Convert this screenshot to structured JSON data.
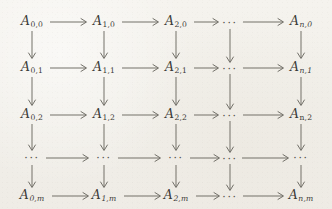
{
  "figure": {
    "kind": "commutative-diagram",
    "background_color": "#f2f0ea",
    "ink_color": "#3b3a36",
    "arrow_color": "#6b6962",
    "columns": 5,
    "rows": 5,
    "ellipsis_text": "···"
  },
  "grid": {
    "column_x": [
      32,
      104,
      176,
      230,
      301
    ],
    "row_y": [
      22,
      68,
      115,
      158,
      196
    ],
    "column_labels": [
      "0",
      "1",
      "2",
      "...",
      "n"
    ],
    "row_labels": [
      "0",
      "1",
      "2",
      "...",
      "m"
    ],
    "nodes": [
      [
        {
          "kind": "object",
          "base": "A",
          "sub": "0,0",
          "sub_italic": false
        },
        {
          "kind": "object",
          "base": "A",
          "sub": "1,0",
          "sub_italic": false
        },
        {
          "kind": "object",
          "base": "A",
          "sub": "2,0",
          "sub_italic": false
        },
        {
          "kind": "ellipsis",
          "text": "···"
        },
        {
          "kind": "object",
          "base": "A",
          "sub": "n,0",
          "sub_italic": true
        }
      ],
      [
        {
          "kind": "object",
          "base": "A",
          "sub": "0,1",
          "sub_italic": false
        },
        {
          "kind": "object",
          "base": "A",
          "sub": "1,1",
          "sub_italic": false
        },
        {
          "kind": "object",
          "base": "A",
          "sub": "2,1",
          "sub_italic": false
        },
        {
          "kind": "ellipsis",
          "text": "···"
        },
        {
          "kind": "object",
          "base": "A",
          "sub": "n,1",
          "sub_italic": true
        }
      ],
      [
        {
          "kind": "object",
          "base": "A",
          "sub": "0,2",
          "sub_italic": false
        },
        {
          "kind": "object",
          "base": "A",
          "sub": "1,2",
          "sub_italic": false
        },
        {
          "kind": "object",
          "base": "A",
          "sub": "2,2",
          "sub_italic": false
        },
        {
          "kind": "ellipsis",
          "text": "···"
        },
        {
          "kind": "object",
          "base": "A",
          "sub": "n,2",
          "sub_italic": false
        }
      ],
      [
        {
          "kind": "ellipsis",
          "text": "···"
        },
        {
          "kind": "ellipsis",
          "text": "···"
        },
        {
          "kind": "ellipsis",
          "text": "···"
        },
        {
          "kind": "ellipsis",
          "text": "···"
        },
        {
          "kind": "ellipsis",
          "text": "···"
        }
      ],
      [
        {
          "kind": "object",
          "base": "A",
          "sub": "0,m",
          "sub_italic": true
        },
        {
          "kind": "object",
          "base": "A",
          "sub": "1,m",
          "sub_italic": true
        },
        {
          "kind": "object",
          "base": "A",
          "sub": "2,m",
          "sub_italic": true
        },
        {
          "kind": "ellipsis",
          "text": "···"
        },
        {
          "kind": "object",
          "base": "A",
          "sub": "n,m",
          "sub_italic": true
        }
      ]
    ]
  },
  "nodes_flat": {
    "r0c0": {
      "base": "A",
      "sub": "0,0"
    },
    "r0c1": {
      "base": "A",
      "sub": "1,0"
    },
    "r0c2": {
      "base": "A",
      "sub": "2,0"
    },
    "r0c3": {
      "text": "···"
    },
    "r0c4": {
      "base": "A",
      "sub": "n,0"
    },
    "r1c0": {
      "base": "A",
      "sub": "0,1"
    },
    "r1c1": {
      "base": "A",
      "sub": "1,1"
    },
    "r1c2": {
      "base": "A",
      "sub": "2,1"
    },
    "r1c3": {
      "text": "···"
    },
    "r1c4": {
      "base": "A",
      "sub": "n,1"
    },
    "r2c0": {
      "base": "A",
      "sub": "0,2"
    },
    "r2c1": {
      "base": "A",
      "sub": "1,2"
    },
    "r2c2": {
      "base": "A",
      "sub": "2,2"
    },
    "r2c3": {
      "text": "···"
    },
    "r2c4": {
      "base": "A",
      "sub": "n,2"
    },
    "r3c0": {
      "text": "···"
    },
    "r3c1": {
      "text": "···"
    },
    "r3c2": {
      "text": "···"
    },
    "r3c3": {
      "text": "···"
    },
    "r3c4": {
      "text": "···"
    },
    "r4c0": {
      "base": "A",
      "sub": "0,m"
    },
    "r4c1": {
      "base": "A",
      "sub": "1,m"
    },
    "r4c2": {
      "base": "A",
      "sub": "2,m"
    },
    "r4c3": {
      "text": "···"
    },
    "r4c4": {
      "base": "A",
      "sub": "n,m"
    }
  },
  "arrows": {
    "horizontal_direction": "right",
    "vertical_direction": "down",
    "horizontal_count": 20,
    "vertical_count": 20,
    "style": "solid-line-with-open-arrowhead"
  }
}
